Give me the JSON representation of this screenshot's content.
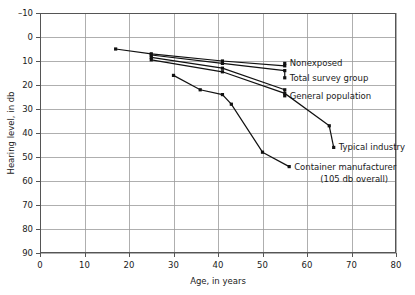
{
  "chart_data": {
    "type": "line",
    "title": "",
    "xlabel": "Age, in years",
    "ylabel": "Hearing level, in db",
    "xlim": [
      0,
      80
    ],
    "ylim": [
      -10,
      90
    ],
    "y_inverted": true,
    "grid": true,
    "legend_position": "inline-right-annotations",
    "xticks": [
      "0",
      "10",
      "20",
      "30",
      "40",
      "50",
      "60",
      "70",
      "80"
    ],
    "yticks": [
      "–10",
      "0",
      "10",
      "20",
      "30",
      "40",
      "50",
      "60",
      "70",
      "80",
      "90"
    ],
    "series": [
      {
        "name": "Nonexposed",
        "label": "Nonexposed",
        "label_x": 55,
        "label_y": 11,
        "points": [
          [
            17,
            5
          ],
          [
            25,
            7
          ],
          [
            41,
            10
          ],
          [
            55,
            12
          ]
        ]
      },
      {
        "name": "Total survey group",
        "label": "Total survey group",
        "label_x": 55,
        "label_y": 17,
        "points": [
          [
            25,
            7.5
          ],
          [
            41,
            11
          ],
          [
            55,
            14
          ]
        ]
      },
      {
        "name": "General population",
        "label": "General population",
        "label_x": 55,
        "label_y": 24.5,
        "points": [
          [
            25,
            8.5
          ],
          [
            41,
            13
          ],
          [
            55,
            22
          ]
        ]
      },
      {
        "name": "Typical industry",
        "label": "Typical industry",
        "label_x": 66,
        "label_y": 46,
        "points": [
          [
            25,
            9.5
          ],
          [
            41,
            14.5
          ],
          [
            55,
            23.5
          ],
          [
            65,
            37
          ]
        ]
      },
      {
        "name": "Container manufacturer",
        "label": "Container manufacturer",
        "label_sub": "(105 db overall)",
        "label_x": 56,
        "label_y": 54,
        "points": [
          [
            30,
            16
          ],
          [
            36,
            22
          ],
          [
            41,
            24
          ],
          [
            43,
            28
          ],
          [
            50,
            48
          ]
        ]
      }
    ],
    "colors": {
      "line": "#111111",
      "marker": "#111111",
      "grid": "#9a9a9a",
      "frame": "#555555",
      "text": "#1a1a1a",
      "background": "#ffffff"
    }
  }
}
